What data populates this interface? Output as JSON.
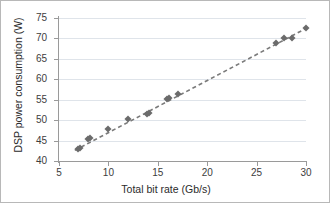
{
  "chart_data": {
    "type": "scatter",
    "title": "",
    "xlabel": "Total bit rate (Gb/s)",
    "ylabel": "DSP power consumption (W)",
    "xlim": [
      5,
      30
    ],
    "ylim": [
      40,
      75
    ],
    "xticks": [
      5,
      10,
      15,
      20,
      25,
      30
    ],
    "yticks": [
      40,
      45,
      50,
      55,
      60,
      65,
      70,
      75
    ],
    "grid": "horizontal",
    "legend": "none",
    "marker_color": "#6b6b6b",
    "marker_shape": "diamond",
    "trendline": {
      "style": "dashed",
      "color": "#7a7a7a",
      "x_start": 6.6,
      "y_start": 42.6,
      "x_end": 30.2,
      "y_end": 72.7
    },
    "points": [
      {
        "x": 6.9,
        "y": 42.9
      },
      {
        "x": 7.1,
        "y": 43.2
      },
      {
        "x": 7.9,
        "y": 45.4
      },
      {
        "x": 8.1,
        "y": 45.6
      },
      {
        "x": 10.0,
        "y": 47.9
      },
      {
        "x": 12.0,
        "y": 50.2
      },
      {
        "x": 13.9,
        "y": 51.4
      },
      {
        "x": 14.1,
        "y": 51.7
      },
      {
        "x": 15.9,
        "y": 55.2
      },
      {
        "x": 16.1,
        "y": 55.4
      },
      {
        "x": 17.0,
        "y": 56.5
      },
      {
        "x": 27.0,
        "y": 68.8
      },
      {
        "x": 27.8,
        "y": 70.0
      },
      {
        "x": 28.6,
        "y": 70.1
      },
      {
        "x": 30.0,
        "y": 72.5
      }
    ]
  }
}
